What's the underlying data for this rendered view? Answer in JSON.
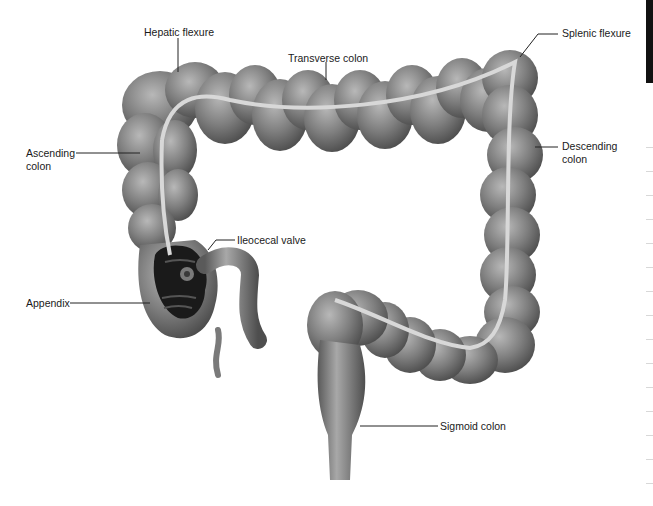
{
  "diagram": {
    "labels": {
      "hepatic_flexure": "Hepatic flexure",
      "transverse_colon": "Transverse colon",
      "splenic_flexure": "Splenic flexure",
      "ascending_colon_line1": "Ascending",
      "ascending_colon_line2": "colon",
      "descending_colon_line1": "Descending",
      "descending_colon_line2": "colon",
      "ileocecal_valve": "Ileocecal valve",
      "appendix": "Appendix",
      "sigmoid_colon": "Sigmoid colon"
    },
    "colors": {
      "tissue_light": "#a8a8a8",
      "tissue_mid": "#7a7a7a",
      "tissue_dark": "#4a4a4a",
      "taenia_band": "#d8d8d8",
      "cecum_interior": "#1a1a1a",
      "leader_line": "#222222"
    }
  }
}
